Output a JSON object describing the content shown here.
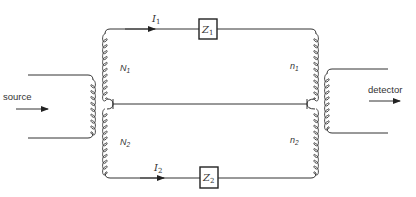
{
  "diagram": {
    "type": "transformer-bridge-circuit",
    "labels": {
      "source": "source",
      "detector": "detector",
      "current_top": "I",
      "current_top_sub": "1",
      "current_bottom": "I",
      "current_bottom_sub": "2",
      "impedance_top": "Z",
      "impedance_top_sub": "1",
      "impedance_bottom": "Z",
      "impedance_bottom_sub": "2",
      "winding_N1": "N",
      "winding_N1_sub": "1",
      "winding_N2": "N",
      "winding_N2_sub": "2",
      "winding_n1": "n",
      "winding_n1_sub": "1",
      "winding_n2": "n",
      "winding_n2_sub": "2"
    },
    "colors": {
      "line": "#333333",
      "background": "#ffffff"
    }
  }
}
